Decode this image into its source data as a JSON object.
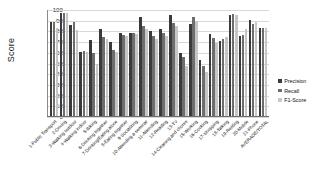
{
  "chart_data": {
    "type": "bar",
    "title": "",
    "xlabel": "",
    "ylabel": "Score",
    "ylim": [
      0,
      100
    ],
    "ytick_step": 10,
    "yticks": [
      100,
      90,
      80,
      70,
      60,
      50,
      40,
      30,
      20,
      10,
      0
    ],
    "grid": true,
    "legend_position": "right",
    "categories": [
      "1-Public Transport",
      "2-Driving",
      "3-Walking outdoor",
      "4-Walking indoor",
      "5-Biking",
      "6-Drinking together",
      "7-Drinking/Eating alone",
      "8-Eating together",
      "9-Socializing",
      "10-Attending a seminar",
      "11-Attending",
      "12-Reading",
      "13-TV",
      "14-Cleaning and chores",
      "15-Working",
      "16-Cooking",
      "17-Shopping",
      "18-Talking",
      "19-Resting",
      "20-Mobile",
      "21-Phone",
      "AVERAGE/TOTAL"
    ],
    "series": [
      {
        "name": "Precision",
        "color": "#3a3a3a",
        "values": [
          88,
          96,
          85,
          60,
          71,
          81,
          69,
          78,
          78,
          93,
          79,
          81,
          94,
          59,
          86,
          52,
          77,
          70,
          94,
          75,
          90,
          82
        ]
      },
      {
        "name": "Recall",
        "color": "#6d6d6d",
        "values": [
          88,
          96,
          88,
          61,
          59,
          74,
          62,
          76,
          78,
          84,
          75,
          78,
          87,
          55,
          93,
          47,
          73,
          72,
          95,
          76,
          86,
          82
        ]
      },
      {
        "name": "F1-Score",
        "color": "#c6c6c6",
        "values": [
          82,
          96,
          80,
          60,
          49,
          72,
          60,
          75,
          77,
          81,
          72,
          75,
          84,
          47,
          89,
          41,
          68,
          74,
          94,
          81,
          88,
          82
        ]
      }
    ]
  },
  "legend": {
    "items": [
      {
        "label": "Precision"
      },
      {
        "label": "Recall"
      },
      {
        "label": "F1-Score"
      }
    ]
  }
}
